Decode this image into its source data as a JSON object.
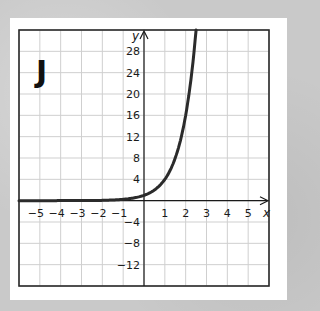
{
  "graph_label": "J",
  "chart_data": {
    "type": "line",
    "title": "J",
    "function": "y = 4^x",
    "xlabel": "x",
    "ylabel": "y",
    "xlim": [
      -6,
      6
    ],
    "ylim": [
      -16,
      32
    ],
    "grid": true,
    "x_ticks": [
      "-5",
      "-4",
      "-3",
      "-2",
      "-1",
      "1",
      "2",
      "3",
      "4",
      "5"
    ],
    "y_ticks": [
      "28",
      "24",
      "20",
      "16",
      "12",
      "8",
      "4",
      "-4",
      "-8",
      "-12"
    ],
    "series": [
      {
        "name": "curve",
        "x": [
          -6,
          -5,
          -4,
          -3,
          -2,
          -1,
          0,
          0.5,
          1,
          1.5,
          2,
          2.25,
          2.5
        ],
        "y": [
          0.0002,
          0.001,
          0.004,
          0.016,
          0.0625,
          0.25,
          1,
          2,
          4,
          8,
          16,
          22.6,
          32
        ]
      }
    ]
  },
  "colors": {
    "background": "#c9c9c9",
    "card": "#ffffff",
    "grid": "#cfcfcf",
    "axis": "#1a1a1a",
    "curve": "#2b2b2b"
  }
}
